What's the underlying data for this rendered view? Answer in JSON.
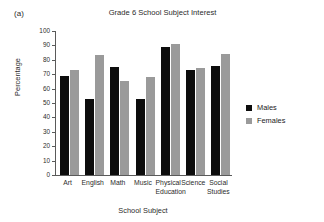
{
  "panel_letter": "(a)",
  "axis_titles": {
    "x": "School Subject",
    "y": "Percentage"
  },
  "legend": {
    "position": "right",
    "items": [
      {
        "label": "Males",
        "color": "#0d0d0d",
        "swatch": "legend-swatch-males"
      },
      {
        "label": "Females",
        "color": "#9a9a9a",
        "swatch": "legend-swatch-females"
      }
    ]
  },
  "yticks": [
    {
      "value": 100,
      "label": "100"
    },
    {
      "value": 90,
      "label": "90"
    },
    {
      "value": 80,
      "label": "80"
    },
    {
      "value": 70,
      "label": "70"
    },
    {
      "value": 60,
      "label": "60"
    },
    {
      "value": 50,
      "label": "50"
    },
    {
      "value": 40,
      "label": "40"
    },
    {
      "value": 30,
      "label": "30"
    },
    {
      "value": 20,
      "label": "20"
    },
    {
      "value": 10,
      "label": "10"
    },
    {
      "value": 0,
      "label": "0"
    }
  ],
  "xticks": [
    {
      "line1": "Art",
      "line2": ""
    },
    {
      "line1": "English",
      "line2": ""
    },
    {
      "line1": "Math",
      "line2": ""
    },
    {
      "line1": "Music",
      "line2": ""
    },
    {
      "line1": "Physical",
      "line2": "Education"
    },
    {
      "line1": "Science",
      "line2": ""
    },
    {
      "line1": "Social",
      "line2": "Studies"
    }
  ],
  "chart_data": {
    "type": "bar",
    "title": "Grade 6 School Subject Interest",
    "xlabel": "School Subject",
    "ylabel": "Percentage",
    "ylim": [
      0,
      100
    ],
    "ytick_step": 10,
    "grid": false,
    "legend_position": "right",
    "categories": [
      "Art",
      "English",
      "Math",
      "Music",
      "Physical Education",
      "Science",
      "Social Studies"
    ],
    "series": [
      {
        "name": "Males",
        "color": "#0d0d0d",
        "values": [
          69,
          53,
          75,
          53,
          89,
          73,
          76
        ]
      },
      {
        "name": "Females",
        "color": "#9a9a9a",
        "values": [
          73,
          83,
          65,
          68,
          91,
          74,
          84
        ]
      }
    ]
  }
}
